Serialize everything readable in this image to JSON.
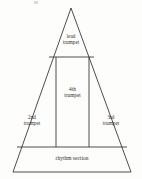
{
  "diagram": {
    "shape": "triangle",
    "stroke_color": "#3a3a38",
    "background_color": "#fdfdfc",
    "text_color": "#2b2b2b",
    "geometry": {
      "apex": [
        71,
        8
      ],
      "base_left": [
        13,
        172
      ],
      "base_right": [
        131,
        172
      ],
      "top_divider_y": 57,
      "top_divider_x_start": 49,
      "top_divider_x_end": 94,
      "inner_left_x": 56,
      "inner_right_x": 89,
      "lower_divider_y": 147,
      "lower_divider_x_start": 17,
      "lower_divider_x_end": 127
    },
    "regions": [
      {
        "id": "lead",
        "name": "lead-trumpet",
        "line1": "lead",
        "line2": "trumpet"
      },
      {
        "id": "fourth",
        "name": "fourth-trumpet",
        "line1": "4th",
        "line2": "trumpet"
      },
      {
        "id": "second",
        "name": "second-trumpet",
        "line1": "2nd",
        "line2": "trumpet"
      },
      {
        "id": "third",
        "name": "third-trumpet",
        "line1": "3rd",
        "line2": "trumpet"
      },
      {
        "id": "rhythm",
        "name": "rhythm-section",
        "line1": "rhythm section",
        "line2": ""
      }
    ]
  }
}
